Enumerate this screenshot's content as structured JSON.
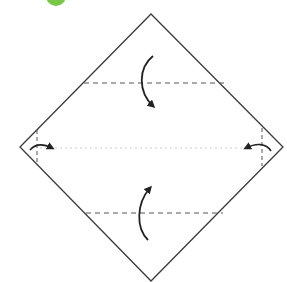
{
  "diagram": {
    "type": "origami-fold-instruction",
    "step_badge": {
      "color": "#79c843"
    },
    "colors": {
      "outline": "#3a3a3a",
      "dashed": "#555555",
      "center_dotted": "#cccccc",
      "arrow": "#222222",
      "background": "#ffffff"
    },
    "square": {
      "top": [
        151,
        14
      ],
      "right": [
        283,
        147
      ],
      "bottom": [
        151,
        281
      ],
      "left": [
        20,
        147
      ]
    },
    "valley_folds": [
      {
        "name": "upper-fold-line",
        "y": 83,
        "x1": 84,
        "x2": 224
      },
      {
        "name": "lower-fold-line",
        "y": 213,
        "x1": 86,
        "x2": 223
      },
      {
        "name": "left-fold-line",
        "x": 37,
        "y1": 130,
        "y2": 165
      },
      {
        "name": "right-fold-line",
        "x": 262,
        "y1": 128,
        "y2": 166
      }
    ],
    "center_line": {
      "y": 148,
      "x1": 40,
      "x2": 250
    },
    "arrows": [
      {
        "name": "fold-top-down-arrow",
        "direction": "down"
      },
      {
        "name": "fold-bottom-up-arrow",
        "direction": "up"
      },
      {
        "name": "fold-left-in-arrow",
        "direction": "right"
      },
      {
        "name": "fold-right-in-arrow",
        "direction": "left"
      }
    ]
  }
}
